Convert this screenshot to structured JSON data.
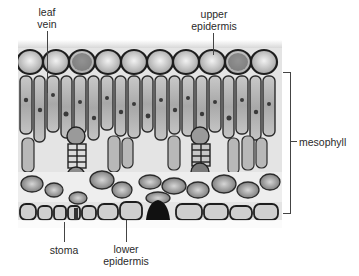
{
  "figure": {
    "labels": {
      "leaf_vein": [
        "leaf",
        "vein"
      ],
      "upper_epidermis": [
        "upper",
        "epidermis"
      ],
      "mesophyll": "mesophyll",
      "stoma": "stoma",
      "lower_epidermis": [
        "lower",
        "epidermis"
      ]
    }
  }
}
